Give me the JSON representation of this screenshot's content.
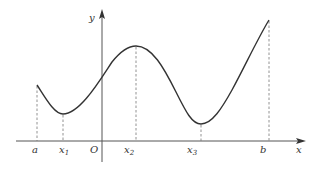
{
  "diagram": {
    "colors": {
      "axis": "#555555",
      "curve": "#333333",
      "guide": "#777777",
      "text": "#333333"
    },
    "axes": {
      "x_label": "x",
      "y_label": "y",
      "origin_label": "O"
    },
    "points": [
      {
        "id": "a",
        "label": "a",
        "sub": ""
      },
      {
        "id": "x1",
        "label": "x",
        "sub": "1"
      },
      {
        "id": "x2",
        "label": "x",
        "sub": "2"
      },
      {
        "id": "x3",
        "label": "x",
        "sub": "3"
      },
      {
        "id": "b",
        "label": "b",
        "sub": ""
      }
    ]
  }
}
